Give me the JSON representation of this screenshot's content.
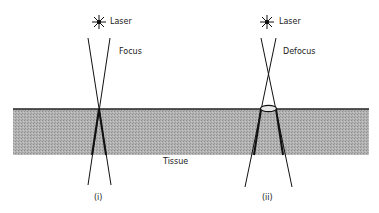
{
  "diagram": {
    "panels": [
      {
        "id": "i",
        "caption": "(i)",
        "laser_label": "Laser",
        "mode_label": "Focus"
      },
      {
        "id": "ii",
        "caption": "(ii)",
        "laser_label": "Laser",
        "mode_label": "Defocus"
      }
    ],
    "medium_label": "Tissue",
    "colors": {
      "tissue": "#a9a9a9",
      "surface": "#222222",
      "beam": "#111111"
    }
  }
}
